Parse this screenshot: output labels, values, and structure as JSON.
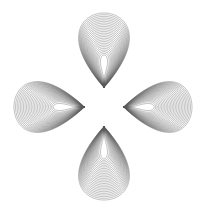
{
  "canvas": {
    "width": 207,
    "height": 214,
    "background": "#ffffff",
    "title": "Four-lobed harmonograph rosette"
  },
  "figure": {
    "name": "four-lobe-spirograph",
    "center_x": 104,
    "center_y": 107,
    "bounds": {
      "left": 14,
      "top": 13,
      "right": 192,
      "bottom": 200
    },
    "lobe_count": 4,
    "curves_per_lobe": 26,
    "stroke_color": "#5a5a5a",
    "stroke_width": 0.45,
    "stroke_opacity": 0.85,
    "central_void": {
      "shape": "rounded-diamond",
      "half_width": 26,
      "half_height": 26
    }
  },
  "chart_data": {
    "type": "line",
    "subtitle": "",
    "xlabel": "",
    "ylabel": "",
    "grid": false,
    "legend": "none",
    "xlim": [
      -104,
      103
    ],
    "ylim": [
      -107,
      107
    ],
    "background": "#ffffff",
    "geometry": {
      "center": [
        104,
        107
      ],
      "lobe_axis_angles_deg": [
        270,
        0,
        90,
        180
      ],
      "loop_inner_radius": 20,
      "loop_outer_radius": 93,
      "loop_half_width_min": 3,
      "loop_half_width_max": 36,
      "waist_radius": 34
    },
    "series": [
      {
        "name": "lobe-top",
        "angle_deg": 270,
        "curves": 26,
        "outer_reach": 94,
        "color": "#5a5a5a"
      },
      {
        "name": "lobe-right",
        "angle_deg": 0,
        "curves": 26,
        "outer_reach": 88,
        "color": "#5a5a5a"
      },
      {
        "name": "lobe-bottom",
        "angle_deg": 90,
        "curves": 26,
        "outer_reach": 93,
        "color": "#5a5a5a"
      },
      {
        "name": "lobe-left",
        "angle_deg": 180,
        "curves": 26,
        "outer_reach": 90,
        "color": "#5a5a5a"
      }
    ]
  }
}
